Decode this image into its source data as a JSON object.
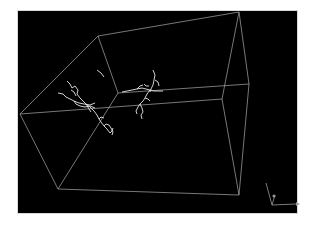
{
  "viewer": {
    "background": "#000000",
    "box_color": "#c8c8c8",
    "neuron_color": "#e8e8e8",
    "axis_color": "#9a9a9a"
  },
  "bounding_box": {
    "vertices": {
      "top_left_back": [
        98,
        36
      ],
      "top_right_back": [
        239,
        12
      ],
      "left_front": [
        20,
        114
      ],
      "right_mid_front": [
        222,
        99
      ],
      "right_mid_back": [
        249,
        84
      ],
      "mid_inner": [
        118,
        93
      ],
      "bottom_left": [
        58,
        189
      ],
      "bottom_right": [
        239,
        195
      ]
    }
  },
  "neurons": [
    {
      "name": "neuron-left"
    },
    {
      "name": "neuron-right"
    }
  ],
  "axis_gizmo": {
    "axes": [
      "x",
      "y",
      "z"
    ]
  }
}
